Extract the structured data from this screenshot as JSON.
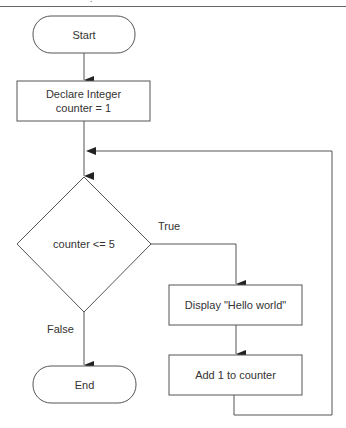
{
  "header": {
    "cutoff_text": ". "
  },
  "flowchart": {
    "start": {
      "label": "Start"
    },
    "declare": {
      "line1": "Declare Integer",
      "line2": "counter = 1"
    },
    "decision": {
      "label": "counter <= 5"
    },
    "branch_true": {
      "label": "True"
    },
    "branch_false": {
      "label": "False"
    },
    "display": {
      "label": "Display \"Hello world\""
    },
    "increment": {
      "label": "Add 1 to counter"
    },
    "end": {
      "label": "End"
    }
  },
  "colors": {
    "stroke": "#555555",
    "text": "#333333",
    "background": "#ffffff"
  }
}
